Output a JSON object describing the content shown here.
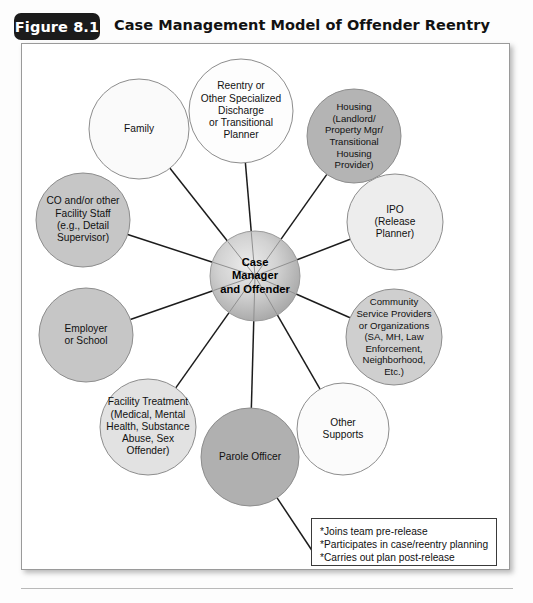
{
  "figure": {
    "tab_label": "Figure 8.1",
    "title": "Case Management Model of Offender Reentry"
  },
  "diagram": {
    "type": "hub-and-spoke",
    "center": {
      "id": "case-manager-and-offender",
      "label": "Case\nManager\nand Offender",
      "lines": [
        "Case",
        "Manager",
        "and Offender"
      ],
      "cx": 233,
      "cy": 232,
      "r": 45,
      "fill": "radial-gradient",
      "fill_colors": [
        "#e6e6e6",
        "#a8a8a8"
      ]
    },
    "nodes": [
      {
        "id": "reentry-planner",
        "lines": [
          "Reentry or",
          "Other Specialized",
          "Discharge",
          "or Transitional",
          "Planner"
        ],
        "cx": 219,
        "cy": 67,
        "r": 52,
        "fill": "#fdfdfd",
        "stroke": "#8d8d8d"
      },
      {
        "id": "housing",
        "lines": [
          "Housing",
          "(Landlord/",
          "Property Mgr/",
          "Transitional",
          "Housing",
          "Provider)"
        ],
        "cx": 332,
        "cy": 92,
        "r": 47,
        "fill": "#b4b4b4",
        "stroke": "#8d8d8d"
      },
      {
        "id": "ipo-release-planner",
        "lines": [
          "IPO",
          "(Release",
          "Planner)"
        ],
        "cx": 373,
        "cy": 178,
        "r": 48,
        "fill": "#ededed",
        "stroke": "#8d8d8d"
      },
      {
        "id": "community-service-providers",
        "lines": [
          "Community",
          "Service Providers",
          "or Organizations",
          "(SA, MH, Law",
          "Enforcement,",
          "Neighborhood,",
          "Etc.)"
        ],
        "cx": 372,
        "cy": 293,
        "r": 48,
        "fill": "#cfcfcf",
        "stroke": "#8d8d8d"
      },
      {
        "id": "other-supports",
        "lines": [
          "Other",
          "Supports"
        ],
        "cx": 321,
        "cy": 385,
        "r": 46,
        "fill": "#fbfbfb",
        "stroke": "#8d8d8d"
      },
      {
        "id": "parole-officer",
        "lines": [
          "Parole Officer"
        ],
        "cx": 228,
        "cy": 413,
        "r": 49,
        "fill": "#b0b0b0",
        "stroke": "#8d8d8d"
      },
      {
        "id": "facility-treatment",
        "lines": [
          "Facility Treatment",
          "(Medical, Mental",
          "Health, Substance",
          "Abuse, Sex",
          "Offender)"
        ],
        "cx": 126,
        "cy": 383,
        "r": 48,
        "fill": "#e2e2e2",
        "stroke": "#8d8d8d"
      },
      {
        "id": "employer-or-school",
        "lines": [
          "Employer",
          "or School"
        ],
        "cx": 64,
        "cy": 291,
        "r": 47,
        "fill": "#c6c6c6",
        "stroke": "#8d8d8d"
      },
      {
        "id": "co-facility-staff",
        "lines": [
          "CO and/or other",
          "Facility Staff",
          "(e.g., Detail",
          "Supervisor)"
        ],
        "cx": 61,
        "cy": 176,
        "r": 47,
        "fill": "#c6c6c6",
        "stroke": "#8d8d8d"
      },
      {
        "id": "family",
        "lines": [
          "Family"
        ],
        "cx": 117,
        "cy": 85,
        "r": 50,
        "fill": "#fafafa",
        "stroke": "#8d8d8d"
      }
    ],
    "legend": {
      "id": "legend-box",
      "items": [
        "*Joins team pre-release",
        "*Participates in case/reentry planning",
        "*Carries out plan post-release"
      ],
      "connector_from": "parole-officer"
    }
  }
}
